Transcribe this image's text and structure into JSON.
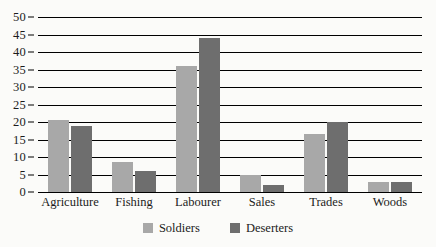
{
  "chart_data": {
    "type": "bar",
    "title": "",
    "subtitle": "",
    "xlabel": "",
    "ylabel": "",
    "categories": [
      "Agriculture",
      "Fishing",
      "Labourer",
      "Sales",
      "Trades",
      "Woods"
    ],
    "series": [
      {
        "name": "Soldiers",
        "color": "#a8a8a8",
        "values": [
          20.5,
          8.5,
          36,
          5,
          16.5,
          3
        ]
      },
      {
        "name": "Deserters",
        "color": "#6e6e6e",
        "values": [
          19,
          6,
          44,
          2,
          20,
          3
        ]
      }
    ],
    "ylim": [
      0,
      50
    ],
    "ytick_step": 5,
    "yticks": [
      0,
      5,
      10,
      15,
      20,
      25,
      30,
      35,
      40,
      45,
      50
    ],
    "ytick_labels": [
      "0",
      "5",
      "10",
      "15",
      "20",
      "25",
      "30",
      "35",
      "40",
      "45",
      "50"
    ],
    "grid": true,
    "grid_axis": "y",
    "legend_position": "bottom",
    "legend_entries": [
      "Soldiers",
      "Deserters"
    ],
    "background_color": "#fbfbf9",
    "grid_color": "#000000"
  }
}
